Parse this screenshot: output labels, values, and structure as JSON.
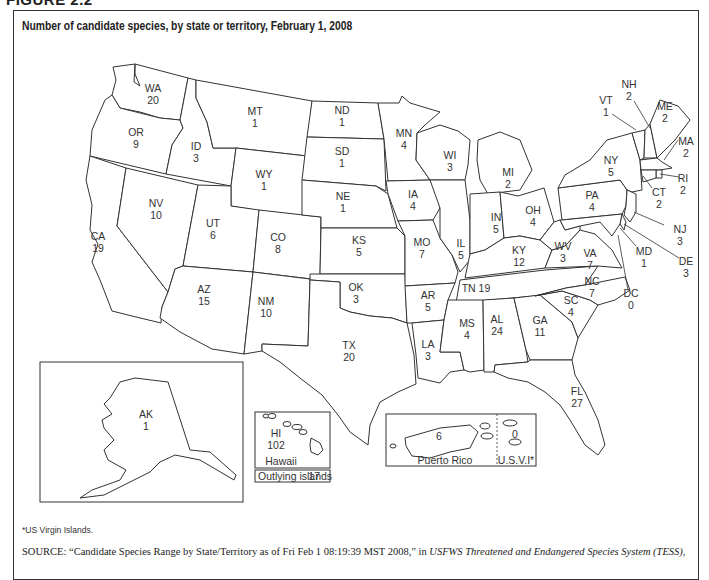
{
  "figure_label": "FIGURE 2.2",
  "title": "Number of candidate species, by state or territory, February 1, 2008",
  "chart_data": {
    "type": "choropleth-labels",
    "title": "Number of candidate species, by state or territory, February 1, 2008",
    "unit": "candidate species",
    "regions": [
      {
        "code": "WA",
        "value": 20
      },
      {
        "code": "OR",
        "value": 9
      },
      {
        "code": "CA",
        "value": 19
      },
      {
        "code": "ID",
        "value": 3
      },
      {
        "code": "NV",
        "value": 10
      },
      {
        "code": "MT",
        "value": 1
      },
      {
        "code": "WY",
        "value": 1
      },
      {
        "code": "UT",
        "value": 6
      },
      {
        "code": "AZ",
        "value": 15
      },
      {
        "code": "CO",
        "value": 8
      },
      {
        "code": "NM",
        "value": 10
      },
      {
        "code": "ND",
        "value": 1
      },
      {
        "code": "SD",
        "value": 1
      },
      {
        "code": "NE",
        "value": 1
      },
      {
        "code": "KS",
        "value": 5
      },
      {
        "code": "OK",
        "value": 3
      },
      {
        "code": "TX",
        "value": 20
      },
      {
        "code": "MN",
        "value": 4
      },
      {
        "code": "IA",
        "value": 4
      },
      {
        "code": "MO",
        "value": 7
      },
      {
        "code": "AR",
        "value": 5
      },
      {
        "code": "LA",
        "value": 3
      },
      {
        "code": "WI",
        "value": 3
      },
      {
        "code": "IL",
        "value": 5
      },
      {
        "code": "MI",
        "value": 2
      },
      {
        "code": "IN",
        "value": 5
      },
      {
        "code": "OH",
        "value": 4
      },
      {
        "code": "KY",
        "value": 12
      },
      {
        "code": "TN",
        "value": 19
      },
      {
        "code": "MS",
        "value": 4
      },
      {
        "code": "AL",
        "value": 24
      },
      {
        "code": "GA",
        "value": 11
      },
      {
        "code": "FL",
        "value": 27
      },
      {
        "code": "SC",
        "value": 4
      },
      {
        "code": "NC",
        "value": 7
      },
      {
        "code": "VA",
        "value": 7
      },
      {
        "code": "WV",
        "value": 3
      },
      {
        "code": "PA",
        "value": 4
      },
      {
        "code": "NY",
        "value": 5
      },
      {
        "code": "VT",
        "value": 1
      },
      {
        "code": "NH",
        "value": 2
      },
      {
        "code": "ME",
        "value": 2
      },
      {
        "code": "MA",
        "value": 2
      },
      {
        "code": "RI",
        "value": 2
      },
      {
        "code": "CT",
        "value": 2
      },
      {
        "code": "NJ",
        "value": 3
      },
      {
        "code": "DE",
        "value": 3
      },
      {
        "code": "MD",
        "value": 1
      },
      {
        "code": "DC",
        "value": 0
      },
      {
        "code": "AK",
        "value": 1
      },
      {
        "code": "HI",
        "value": 102
      },
      {
        "code": "PR",
        "value": 6
      },
      {
        "code": "USVI",
        "value": 0
      }
    ],
    "insets": {
      "hawaii_caption": "Hawaii",
      "outlying_islands_label": "Outlying islands",
      "outlying_islands_value": 17,
      "puerto_rico_caption": "Puerto Rico",
      "usvi_caption": "U.S.V.I*"
    }
  },
  "footnote": "*US Virgin Islands.",
  "source": {
    "prefix": "SOURCE:",
    "quote": " “Candidate Species Range by State/Territory as of Fri Feb 1 08:19:39 MST 2008,” in ",
    "publication": "USFWS Threatened and Endangered Species System (TESS)",
    "suffix": ","
  }
}
